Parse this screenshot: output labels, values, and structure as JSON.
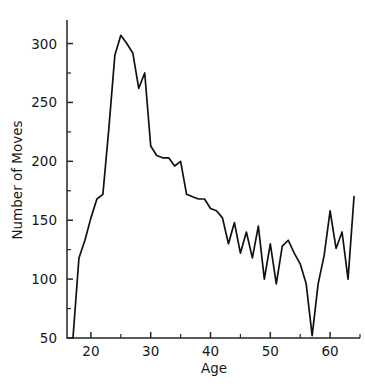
{
  "figure": {
    "clipped_title_fragment": "",
    "background_color": "#ffffff",
    "line_color": "#111111",
    "axis_color": "#262626"
  },
  "chart_data": {
    "type": "line",
    "title": "",
    "xlabel": "Age",
    "ylabel": "Number of Moves",
    "xlim": [
      16,
      65
    ],
    "ylim": [
      50,
      320
    ],
    "grid": false,
    "legend": null,
    "x_ticks_major": [
      20,
      30,
      40,
      50,
      60
    ],
    "x_tick_labels": [
      "20",
      "30",
      "40",
      "50",
      "60"
    ],
    "x_ticks_minor": [
      25,
      35,
      45,
      55,
      65
    ],
    "y_ticks_major": [
      50,
      100,
      150,
      200,
      250,
      300
    ],
    "y_tick_labels": [
      "50",
      "100",
      "150",
      "200",
      "250",
      "300"
    ],
    "y_ticks_minor": [
      75,
      125,
      175,
      225,
      275
    ],
    "series": [
      {
        "name": "Number of Moves",
        "x": [
          17,
          18,
          19,
          20,
          21,
          22,
          23,
          24,
          25,
          26,
          27,
          28,
          29,
          30,
          31,
          32,
          33,
          34,
          35,
          36,
          37,
          38,
          39,
          40,
          41,
          42,
          43,
          44,
          45,
          46,
          47,
          48,
          49,
          50,
          51,
          52,
          53,
          54,
          55,
          56,
          57,
          58,
          59,
          60,
          61,
          62,
          63,
          64
        ],
        "values": [
          50,
          118,
          133,
          152,
          168,
          172,
          228,
          290,
          307,
          300,
          292,
          262,
          275,
          213,
          205,
          203,
          203,
          196,
          200,
          172,
          170,
          168,
          168,
          160,
          158,
          152,
          130,
          148,
          122,
          140,
          118,
          145,
          100,
          130,
          96,
          128,
          133,
          122,
          113,
          96,
          52,
          96,
          120,
          158,
          126,
          140,
          100,
          170
        ]
      }
    ]
  }
}
